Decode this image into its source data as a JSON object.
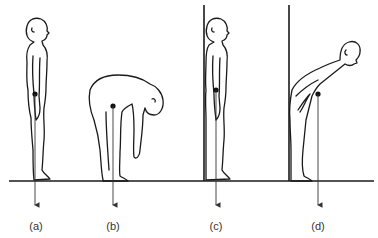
{
  "diagram": {
    "type": "posture-center-of-gravity",
    "colors": {
      "line": "#1a1a1a",
      "background": "#ffffff",
      "label": "#333333"
    },
    "panels": [
      {
        "id": "a",
        "label": "(a)",
        "pose": "standing upright",
        "wall": false
      },
      {
        "id": "b",
        "label": "(b)",
        "pose": "bending forward touching toes",
        "wall": false
      },
      {
        "id": "c",
        "label": "(c)",
        "pose": "standing upright against wall",
        "wall": true
      },
      {
        "id": "d",
        "label": "(d)",
        "pose": "bending forward with back against wall",
        "wall": true
      }
    ]
  }
}
